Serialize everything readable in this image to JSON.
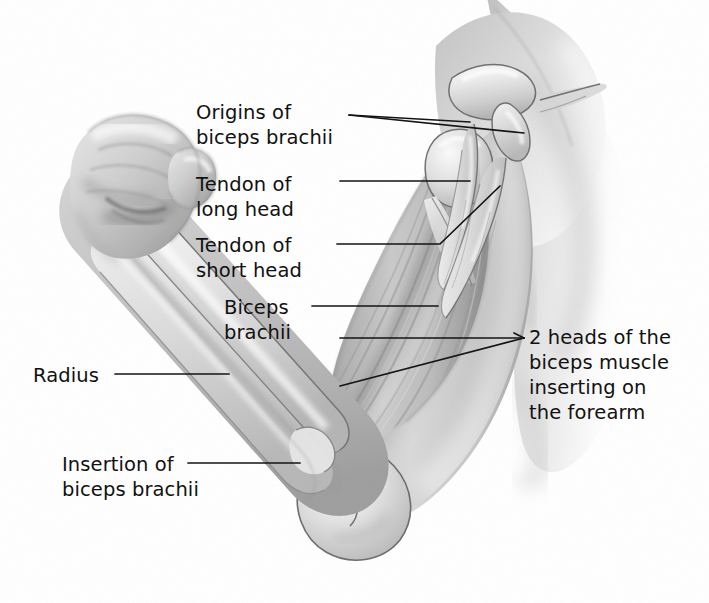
{
  "figure": {
    "style": "grayscale pencil / airbrush medical illustration",
    "background_color": "#ffffff",
    "ink_color": "#111111",
    "width": 709,
    "height": 603
  },
  "labels": [
    {
      "id": "origins",
      "text": "Origins of\nbiceps brachii",
      "align": "left",
      "x": 196,
      "y": 100,
      "lines": 2
    },
    {
      "id": "tendon-long-head",
      "text": "Tendon of\nlong head",
      "align": "left",
      "x": 196,
      "y": 172,
      "lines": 2
    },
    {
      "id": "tendon-short-head",
      "text": "Tendon of\nshort head",
      "align": "left",
      "x": 196,
      "y": 233,
      "lines": 2
    },
    {
      "id": "biceps-brachii",
      "text": "Biceps\nbrachii",
      "align": "left",
      "x": 224,
      "y": 295,
      "lines": 2
    },
    {
      "id": "radius",
      "text": "Radius",
      "align": "left",
      "x": 33,
      "y": 374,
      "lines": 1
    },
    {
      "id": "insertion",
      "text": "Insertion of\nbiceps brachii",
      "align": "left",
      "x": 62,
      "y": 452,
      "lines": 2
    },
    {
      "id": "two-heads",
      "text": "2 heads of the\nbiceps muscle\ninserting on\nthe forearm",
      "align": "left",
      "x": 529,
      "y": 325,
      "lines": 4
    }
  ],
  "structures": [
    {
      "id": "fist",
      "name": "clenched fist"
    },
    {
      "id": "forearm",
      "name": "forearm"
    },
    {
      "id": "radius-bone",
      "name": "radius"
    },
    {
      "id": "ulna-bone",
      "name": "ulna"
    },
    {
      "id": "elbow-joint",
      "name": "elbow joint"
    },
    {
      "id": "humerus-condyle",
      "name": "humeral condyles"
    },
    {
      "id": "biceps-belly",
      "name": "biceps brachii muscle belly"
    },
    {
      "id": "long-head-tendon",
      "name": "tendon of long head"
    },
    {
      "id": "short-head-tendon",
      "name": "tendon of short head"
    },
    {
      "id": "clavicle",
      "name": "clavicle"
    },
    {
      "id": "coracoid",
      "name": "coracoid process"
    },
    {
      "id": "humeral-head",
      "name": "head of humerus"
    },
    {
      "id": "scapula-spine",
      "name": "scapula / acromion"
    },
    {
      "id": "torso",
      "name": "torso and shoulder contour"
    }
  ],
  "palette": {
    "paper": "#ffffff",
    "ink": "#111111",
    "flesh_light": "#efefef",
    "flesh_mid": "#cccccc",
    "flesh_shadow": "#a8a8a8",
    "muscle_mid": "#b4b4b4",
    "muscle_dark": "#8e8e8e",
    "bone_light": "#f4f4f4",
    "bone_shadow": "#bdbdbd",
    "outline": "#6d6d6d"
  }
}
